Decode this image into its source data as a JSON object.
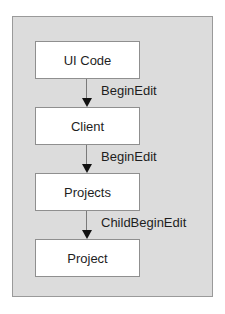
{
  "diagram": {
    "type": "flow",
    "direction": "top-to-bottom",
    "colors": {
      "panel_background": "#dcdcdc",
      "panel_border": "#9a9a9a",
      "node_fill": "#ffffff",
      "node_border": "#8f8f8f",
      "arrow": "#111111"
    },
    "nodes": [
      {
        "id": "ui-code",
        "label": "UI Code"
      },
      {
        "id": "client",
        "label": "Client"
      },
      {
        "id": "projects",
        "label": "Projects"
      },
      {
        "id": "project",
        "label": "Project"
      }
    ],
    "edges": [
      {
        "from": "ui-code",
        "to": "client",
        "label": "BeginEdit"
      },
      {
        "from": "client",
        "to": "projects",
        "label": "BeginEdit"
      },
      {
        "from": "projects",
        "to": "project",
        "label": "ChildBeginEdit"
      }
    ]
  }
}
